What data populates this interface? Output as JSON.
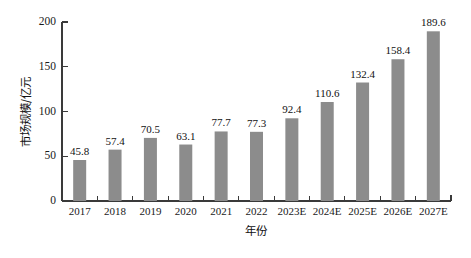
{
  "chart_data": {
    "type": "bar",
    "title": "",
    "subtitle": "",
    "xlabel": "年份",
    "ylabel": "市场规模/亿元",
    "categories": [
      "2017",
      "2018",
      "2019",
      "2020",
      "2021",
      "2022",
      "2023E",
      "2024E",
      "2025E",
      "2026E",
      "2027E"
    ],
    "values": [
      45.8,
      57.4,
      70.5,
      63.1,
      77.7,
      77.3,
      92.4,
      110.6,
      132.4,
      158.4,
      189.6
    ],
    "value_labels": [
      "45.8",
      "57.4",
      "70.5",
      "63.1",
      "77.7",
      "77.3",
      "92.4",
      "110.6",
      "132.4",
      "158.4",
      "189.6"
    ],
    "ylim": [
      0,
      200
    ],
    "yticks": [
      0,
      50,
      100,
      150,
      200
    ],
    "ytick_labels": [
      "0",
      "50",
      "100",
      "150",
      "200"
    ],
    "grid": false,
    "legend": null,
    "legend_position": "none",
    "bar_color": "#8c8c8c",
    "axis_color": "#3a3a3a",
    "text_color": "#111111",
    "background": "#ffffff",
    "data_labels_shown": true
  }
}
